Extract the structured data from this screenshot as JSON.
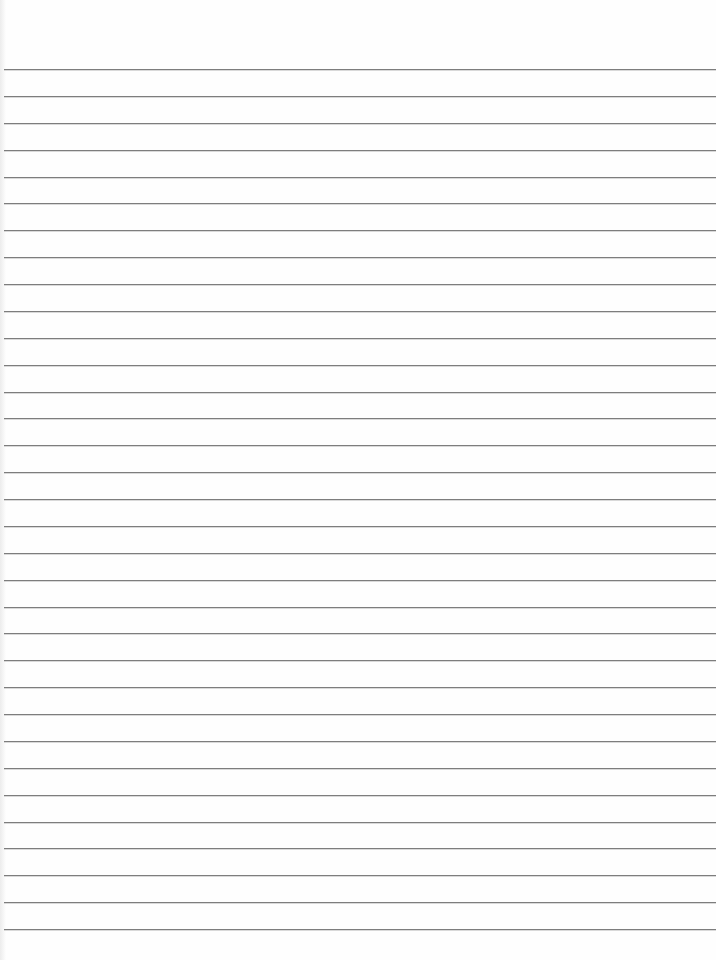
{
  "paper": {
    "type": "lined notebook paper",
    "line_count": 33,
    "line_color": "#7d7d7d",
    "background_color": "#fefefe",
    "content_text": ""
  }
}
